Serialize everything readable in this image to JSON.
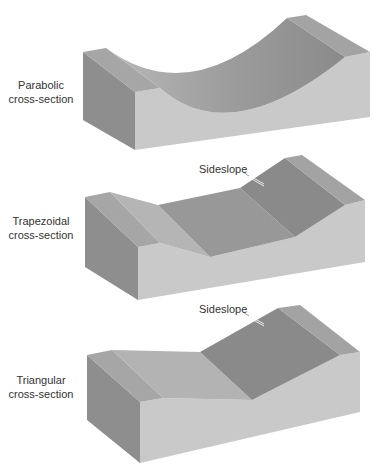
{
  "figure": {
    "panels": [
      {
        "id": "parabolic",
        "label_line1": "Parabolic",
        "label_line2": "cross-section",
        "callout": null
      },
      {
        "id": "trapezoidal",
        "label_line1": "Trapezoidal",
        "label_line2": "cross-section",
        "callout": "Sideslope"
      },
      {
        "id": "triangular",
        "label_line1": "Triangular",
        "label_line2": "cross-section",
        "callout": "Sideslope"
      }
    ],
    "colors": {
      "background": "#ffffff",
      "front_face": "#c9c9c9",
      "side_face": "#8e8e8e",
      "top_flat": "#a9a9a9",
      "channel_light": "#b3b3b3",
      "channel_dark": "#8a8a8a",
      "text": "#333333"
    }
  }
}
